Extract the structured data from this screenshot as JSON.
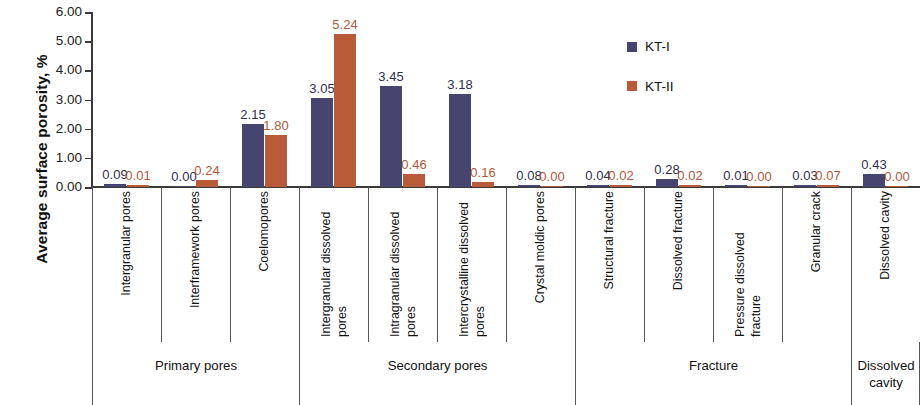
{
  "chart_data": {
    "type": "bar",
    "title": "",
    "xlabel": "",
    "ylabel": "Average surface porosity, %",
    "ylim": [
      0,
      6
    ],
    "ytick_labels": [
      "6.00",
      "5.00",
      "4.00",
      "3.00",
      "2.00",
      "1.00",
      "0.00"
    ],
    "ytick_values": [
      6,
      5,
      4,
      3,
      2,
      1,
      0
    ],
    "grid": false,
    "legend_position": "upper-right-inside",
    "categories": [
      "Intergranular pores",
      "Interframework pores",
      "Coelomopores",
      "Intergranular dissolved pores",
      "Intragranular dissolved pores",
      "Intercrystalline dissolved pores",
      "Crystal moldic pores",
      "Structural fracture",
      "Dissolved fracture",
      "Pressure dissolved fracture",
      "Granular crack",
      "Dissolved cavity"
    ],
    "series": [
      {
        "name": "KT-I",
        "color": "#45456f",
        "values": [
          0.09,
          0.0,
          2.15,
          3.05,
          3.45,
          3.18,
          0.08,
          0.04,
          0.28,
          0.01,
          0.03,
          0.43
        ],
        "labels": [
          "0.09",
          "0.00",
          "2.15",
          "3.05",
          "3.45",
          "3.18",
          "0.08",
          "0.04",
          "0.28",
          "0.01",
          "0.03",
          "0.43"
        ]
      },
      {
        "name": "KT-II",
        "color": "#b95b39",
        "values": [
          0.01,
          0.24,
          1.8,
          5.24,
          0.46,
          0.16,
          0.0,
          0.02,
          0.02,
          0.0,
          0.07,
          0.0
        ],
        "labels": [
          "0.01",
          "0.24",
          "1.80",
          "5.24",
          "0.46",
          "0.16",
          "0.00",
          "0.02",
          "0.02",
          "0.00",
          "0.07",
          "0.00"
        ]
      }
    ],
    "groups": [
      {
        "label": "Primary pores",
        "start": 0,
        "end": 2
      },
      {
        "label": "Secondary pores",
        "start": 3,
        "end": 6
      },
      {
        "label": "Fracture",
        "start": 7,
        "end": 10
      },
      {
        "label": "Dissolved cavity",
        "start": 11,
        "end": 11
      }
    ]
  },
  "legend": {
    "items": [
      {
        "label": "KT-I",
        "color": "#45456f"
      },
      {
        "label": "KT-II",
        "color": "#b95b39"
      }
    ]
  }
}
